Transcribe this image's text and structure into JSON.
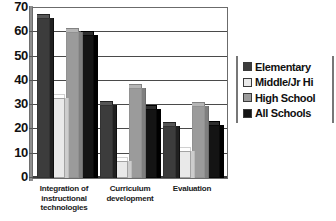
{
  "chart_data": {
    "type": "bar",
    "title": "",
    "subtitle": "",
    "xlabel": "",
    "ylabel": "",
    "ylim": [
      0,
      70
    ],
    "ytick_step": 10,
    "yticks": [
      70,
      60,
      50,
      40,
      30,
      20,
      10,
      0
    ],
    "grid": true,
    "legend_position": "right",
    "categories": [
      "Integration of instructional technologies",
      "Curriculum development",
      "Evaluation"
    ],
    "category_label_lines": [
      [
        "Integration of",
        "instructional",
        "technologies"
      ],
      [
        "Curriculum",
        "development"
      ],
      [
        "Evaluation"
      ]
    ],
    "series": [
      {
        "name": "Elementary",
        "color": "#3c3c3c",
        "values": [
          66,
          30,
          21.5
        ]
      },
      {
        "name": "Middle/Jr Hi",
        "color": "#e9e9e9",
        "values": [
          33,
          7,
          11
        ]
      },
      {
        "name": "High School",
        "color": "#9b9b9b",
        "values": [
          60,
          37,
          29.5
        ]
      },
      {
        "name": "All Schools",
        "color": "#141414",
        "values": [
          59,
          28.5,
          22
        ]
      }
    ]
  },
  "legend": {
    "items": [
      {
        "label": "Elementary"
      },
      {
        "label": "Middle/Jr Hi"
      },
      {
        "label": "High School"
      },
      {
        "label": "All Schools"
      }
    ]
  },
  "axis": {
    "y_tick_labels": [
      "70",
      "60",
      "50",
      "40",
      "30",
      "20",
      "10",
      "0"
    ]
  },
  "x_axis": {
    "labels": [
      {
        "lines": [
          "Integration of",
          "instructional",
          "technologies"
        ]
      },
      {
        "lines": [
          "Curriculum",
          "development"
        ]
      },
      {
        "lines": [
          "Evaluation"
        ]
      }
    ]
  }
}
